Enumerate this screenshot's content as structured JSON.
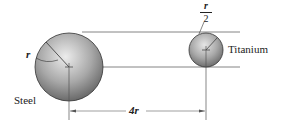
{
  "diagram": {
    "labels": {
      "steel": "Steel",
      "titanium": "Titanium",
      "radius_large": "r",
      "separation": "4r",
      "radius_small_num": "r",
      "radius_small_den": "2"
    },
    "colors": {
      "sphere_light": "#eaeaea",
      "sphere_dark": "#6a6a6a",
      "line": "#555555",
      "text": "#222222"
    }
  }
}
